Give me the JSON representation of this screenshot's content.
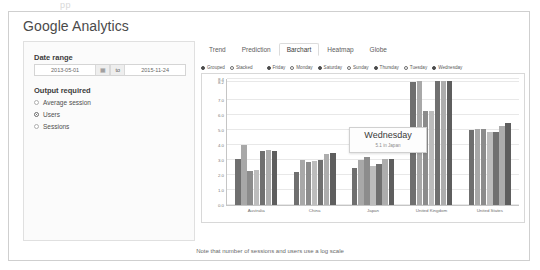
{
  "artifact": {
    "text": "pp"
  },
  "header": {
    "title": "Google Analytics"
  },
  "sidebar": {
    "date_range": {
      "label": "Date range",
      "start_value": "2013-05-01",
      "end_value": "2015-11-24",
      "separator_label": "to",
      "calendar_icon": "calendar-icon"
    },
    "output_required": {
      "label": "Output required",
      "options": [
        {
          "label": "Average session",
          "selected": false
        },
        {
          "label": "Users",
          "selected": true
        },
        {
          "label": "Sessions",
          "selected": false
        }
      ]
    }
  },
  "tabs": [
    {
      "label": "Trend",
      "active": false
    },
    {
      "label": "Prediction",
      "active": false
    },
    {
      "label": "Barchart",
      "active": true
    },
    {
      "label": "Heatmap",
      "active": false
    },
    {
      "label": "Globe",
      "active": false
    }
  ],
  "legend": {
    "mode_options": [
      {
        "label": "Grouped",
        "selected": true
      },
      {
        "label": "Stacked",
        "selected": false
      }
    ],
    "day_options": [
      {
        "label": "Friday",
        "selected": true
      },
      {
        "label": "Monday",
        "selected": false
      },
      {
        "label": "Saturday",
        "selected": true
      },
      {
        "label": "Sunday",
        "selected": false
      },
      {
        "label": "Thursday",
        "selected": true
      },
      {
        "label": "Tuesday",
        "selected": false
      },
      {
        "label": "Wednesday",
        "selected": true
      }
    ]
  },
  "tooltip": {
    "title": "Wednesday",
    "subtitle": "5.1 in Japan"
  },
  "footer": {
    "note": "Note that number of sessions and users use a log scale"
  },
  "chart_data": {
    "type": "bar",
    "title": "",
    "xlabel": "",
    "ylabel": "",
    "ylim": [
      0.0,
      8.4
    ],
    "grid": true,
    "legend_position": "top",
    "yticks": [
      "0.0",
      "1.0",
      "2.0",
      "3.0",
      "4.0",
      "5.0",
      "6.0",
      "7.0",
      "8.2",
      "8.4"
    ],
    "ytick_values": [
      0.0,
      1.0,
      2.0,
      3.0,
      4.0,
      5.0,
      6.0,
      7.0,
      8.2,
      8.4
    ],
    "categories": [
      "Australia",
      "China",
      "Japan",
      "United Kingdom",
      "United States"
    ],
    "series": [
      {
        "name": "Friday",
        "color": "#6f6f6f",
        "values": [
          3.1,
          2.2,
          2.5,
          8.2,
          5.0
        ]
      },
      {
        "name": "Monday",
        "color": "#a8a8a8",
        "values": [
          4.0,
          3.0,
          3.0,
          8.3,
          5.1
        ]
      },
      {
        "name": "Saturday",
        "color": "#8c8c8c",
        "values": [
          2.3,
          2.9,
          3.2,
          6.3,
          5.05
        ]
      },
      {
        "name": "Sunday",
        "color": "#bdbdbd",
        "values": [
          2.35,
          2.95,
          2.6,
          6.3,
          4.85
        ]
      },
      {
        "name": "Thursday",
        "color": "#707070",
        "values": [
          3.6,
          3.0,
          2.75,
          8.3,
          4.9
        ]
      },
      {
        "name": "Tuesday",
        "color": "#adadad",
        "values": [
          3.7,
          3.4,
          3.1,
          8.3,
          5.3
        ]
      },
      {
        "name": "Wednesday",
        "color": "#5e5e5e",
        "values": [
          3.6,
          3.5,
          3.1,
          8.3,
          5.5
        ]
      }
    ]
  }
}
